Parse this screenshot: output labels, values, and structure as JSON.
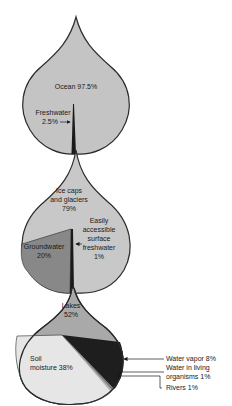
{
  "colors": {
    "ocean": "#c4c4c4",
    "freshwater": "#1a1a1a",
    "ice": "#c8c8c8",
    "groundwater": "#888888",
    "surface": "#1a1a1a",
    "lakes": "#a9a9a9",
    "soil": "#e6e6e6",
    "vapor": "#1e1e1e",
    "organisms": "#7a7a7a",
    "rivers": "#b0b0b0",
    "outline": "#2a2a2a"
  },
  "drops": [
    {
      "name": "all-water",
      "segments": [
        {
          "label_lines": [
            "Ocean 97.5%"
          ],
          "name": "Ocean",
          "percent": 97.5
        },
        {
          "label_lines": [
            "Freshwater",
            "2.5%"
          ],
          "name": "Freshwater",
          "percent": 2.5
        }
      ]
    },
    {
      "name": "freshwater",
      "segments": [
        {
          "label_lines": [
            "Ice caps",
            "and glaciers",
            "79%"
          ],
          "name": "Ice caps and glaciers",
          "percent": 79
        },
        {
          "label_lines": [
            "Groundwater",
            "20%"
          ],
          "name": "Groundwater",
          "percent": 20
        },
        {
          "label_lines": [
            "Easily",
            "accessible",
            "surface",
            "freshwater",
            "1%"
          ],
          "name": "Easily accessible surface freshwater",
          "percent": 1
        }
      ]
    },
    {
      "name": "surface-freshwater",
      "segments": [
        {
          "label_lines": [
            "Lakes",
            "52%"
          ],
          "name": "Lakes",
          "percent": 52
        },
        {
          "label_lines": [
            "Soil",
            "moisture 38%"
          ],
          "name": "Soil moisture",
          "percent": 38
        },
        {
          "label_lines": [
            "Water vapor 8%"
          ],
          "name": "Water vapor",
          "percent": 8
        },
        {
          "label_lines": [
            "Water in living",
            "organisms 1%"
          ],
          "name": "Water in living organisms",
          "percent": 1
        },
        {
          "label_lines": [
            "Rivers 1%"
          ],
          "name": "Rivers",
          "percent": 1
        }
      ]
    }
  ]
}
